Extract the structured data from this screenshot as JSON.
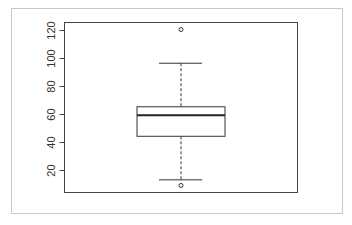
{
  "chart_data": {
    "type": "boxplot",
    "title": "",
    "xlabel": "",
    "ylabel": "",
    "ylim": [
      4,
      124
    ],
    "yticks": [
      20,
      40,
      60,
      80,
      100,
      120
    ],
    "ytick_labels": [
      "20",
      "40",
      "60",
      "80",
      "100",
      "120"
    ],
    "grid": false,
    "legend": null,
    "series": [
      {
        "name": "",
        "whisker_low": 13,
        "q1": 44,
        "median": 59,
        "q3": 65,
        "whisker_high": 96,
        "outliers": [
          120,
          9
        ]
      }
    ]
  },
  "style": {
    "box_color": "#333333",
    "median_color": "#222222",
    "frame_color": "#c8c8c8",
    "axis_color": "#444444"
  }
}
